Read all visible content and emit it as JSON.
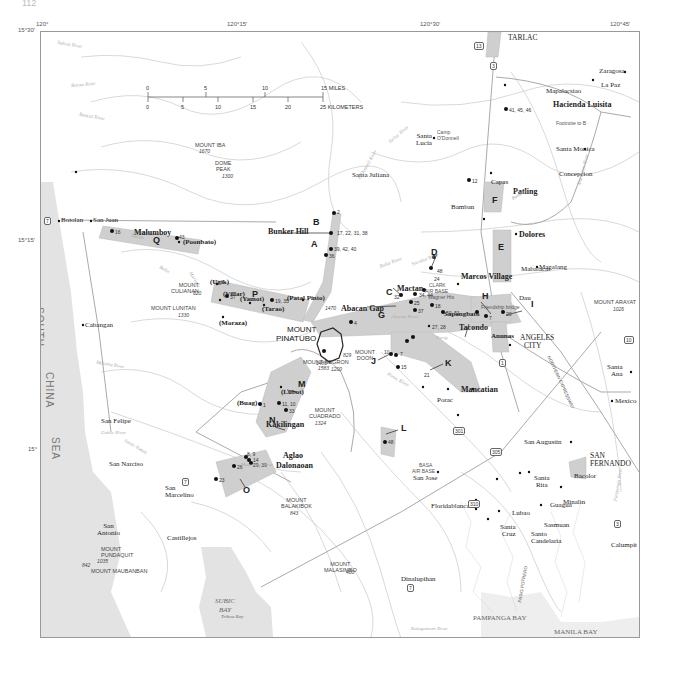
{
  "page": {
    "number": "112"
  },
  "map": {
    "title": "Mount Pinatubo region, Luzon, Philippines",
    "longitude_ticks": [
      "120°",
      "120°15'",
      "120°30'",
      "120°45'"
    ],
    "latitude_ticks": [
      "15°30'",
      "15°15'",
      "15°"
    ],
    "scale_bar": {
      "miles": [
        "0",
        "5",
        "10",
        "15 MILES"
      ],
      "kilometers": [
        "0",
        "5",
        "10",
        "15",
        "20",
        "25 KILOMETERS"
      ]
    },
    "water_bodies": {
      "south_china_sea": [
        "SOUTH",
        "CHINA",
        "SEA"
      ],
      "subic_bay": [
        "SUBIC",
        "BAY"
      ],
      "pampanga_bay": "PAMPANGA BAY",
      "manila_bay": "MANILA BAY",
      "triboa_bay": "Triboa Bay"
    },
    "cities": {
      "tarlac": "TARLAC",
      "angeles": [
        "ANGELES",
        "CITY"
      ],
      "san_fernando": [
        "SAN",
        "FERNANDO"
      ],
      "clark": [
        "CLARK",
        "AIR BASE"
      ],
      "basa": [
        "BASA",
        "AIR BASE"
      ]
    },
    "towns": {
      "botolan": "Botolan",
      "san_juan": "San Juan",
      "malumboy": "Malumboy",
      "poonbato": "(Poonbato)",
      "cabangan": "Cabangan",
      "san_felipe": "San Felipe",
      "san_narciso": "San Narciso",
      "san_marcelino": [
        "San",
        "Marcelino"
      ],
      "san_antonio": [
        "San",
        "Antonio"
      ],
      "castillejos": "Castillejos",
      "ugik": "(Ugik)",
      "villar": "(Villar)",
      "yamot": "(Yamot)",
      "tarao": "(Tarao)",
      "patal_pinto": "(Patal Pinto)",
      "moraza": "(Moraza)",
      "bunker_hill": "Bunker Hill",
      "santa_lucia": [
        "Santa",
        "Lucia"
      ],
      "camp_odonnell": [
        "Camp",
        "O'Donnell"
      ],
      "santa_juliana": "Santa Juliana",
      "mapalacsiao": "Mapalacsiao",
      "hacienda_luisita": "Hacienda Luisita",
      "footnote_b": "Footnote to B",
      "la_paz": "La Paz",
      "zaragosa": "Zaragosa",
      "santa_monica": "Santa Monica",
      "concepcion": "Concepcion",
      "capas": "Capas",
      "patling": "Patling",
      "bamban": "Bamban",
      "dolores": "Dolores",
      "mabalacat": "Mabalacat",
      "magalang": "Magalang",
      "marcos_village": "Marcos Village",
      "mactan": "Mactan",
      "abacan_gap": "Abacan Gap",
      "wagner_hts": "Wagner Hts",
      "sapangbato": "Sapangbato",
      "friendship_bridge": "Friendship bridge",
      "dau": "Dau",
      "tacondo": "Tacondo",
      "anunas": "Anunas",
      "mancatian": "Mancatian",
      "porac": "Porac",
      "santa_ana": [
        "Santa",
        "Ana"
      ],
      "mexico": "Mexico",
      "san_augustin": "San Augustin",
      "santa_rita": [
        "Santa",
        "Rita"
      ],
      "bacolor": "Bacolor",
      "guagua": "Guagua",
      "minalin": "Minalin",
      "lubao": "Lubao",
      "sasmuan": "Sasmuan",
      "santa_cruz": [
        "Santa",
        "Cruz"
      ],
      "santo_candelaria": [
        "Santo",
        "Candelaria"
      ],
      "calumpit": "Calumpit",
      "san_jose": "San Jose",
      "floridablanca": "Floridablanca",
      "dinalupihan": "Dinalupihan",
      "buag": "(Buag)",
      "lubot": "(Lubot)",
      "kakilingan": "Kakilingan",
      "aglao": "Aglao",
      "dalonaoan": "Dalonaoan"
    },
    "mountains": [
      {
        "name": [
          "MOUNT IBA"
        ],
        "elev": "1670"
      },
      {
        "name": [
          "DOME",
          "PEAK"
        ],
        "elev": "1300"
      },
      {
        "name": [
          "MOUNT",
          "CULIANAN"
        ],
        "elev": "620"
      },
      {
        "name": [
          "MOUNT LUNITAN"
        ],
        "elev": "1330"
      },
      {
        "name": [
          "MOUNT",
          "PINATUBO"
        ],
        "elev": "1486"
      },
      {
        "name": [
          "MOUNT NEGRON"
        ],
        "elev": "1583"
      },
      {
        "name": [
          "MOUNT",
          "CUADRADO"
        ],
        "elev": "1324"
      },
      {
        "name": [
          "MOUNT",
          "BALAKIBOK"
        ],
        "elev": "843"
      },
      {
        "name": [
          "MOUNT",
          "MALASIMBO"
        ],
        "elev": "400"
      },
      {
        "name": [
          "MOUNT",
          "PUNDAQUIT"
        ],
        "elev": "1035"
      },
      {
        "name": [
          "MOUNT MAUBANBAN"
        ],
        "elev": "842"
      },
      {
        "name": [
          "MOUNT ARAYAT"
        ],
        "elev": "1026"
      },
      {
        "name": [
          "MOUNT",
          "DOON"
        ],
        "elev": "829"
      }
    ],
    "spot_elevations": {
      "e1470": "1470",
      "e1200": "1200"
    },
    "zones": [
      "A",
      "B",
      "C",
      "D",
      "E",
      "F",
      "G",
      "H",
      "I",
      "J",
      "K",
      "L",
      "M",
      "N",
      "O",
      "P",
      "Q"
    ],
    "site_labels": {
      "b_sites": "2",
      "bunker_sites": "17, 22, 31, 38",
      "a_sites": "39, 42, 40",
      "a_site2": "36",
      "f_site": "12",
      "hacienda_sites": "41, 45, 46",
      "q_site1": "16",
      "q_site2": "43",
      "p_site1": "37",
      "p_site2": "19, 35",
      "g_site": "4",
      "mactan_sites": "34, 44",
      "mactan_site2": "32",
      "mactan_site3": "25",
      "mactan_site4": "18",
      "c_site": "37",
      "g_sites2": "27, 28",
      "d_site1": "48",
      "d_site2": "24",
      "sap_site": "50, 51",
      "h_site": "7",
      "i_site": "20",
      "j_sites1": "10",
      "j_sites2": "7",
      "j_sites3": "15",
      "k_site": "21",
      "l_site": "48",
      "n_site1": "1",
      "n_site2": "11, 10",
      "n_site3": "33",
      "o_site1": "8, 9",
      "o_site2": "14",
      "o_site3": "29, 39",
      "o_site4": "26",
      "o_site5": "23"
    },
    "rivers": {
      "sulcon": "Sulcon River",
      "bucao_n": "Bucao River",
      "bancal": "Bancal River",
      "bucao": "Bucao",
      "balin": "Balin",
      "marimla": "Marimla",
      "maloma": "Maloma River",
      "gabor": "Gabor River",
      "sto_tomas": "Santo Tomas",
      "abacan": "Abacan River",
      "pasig": "Pasig",
      "porac": "Porac River",
      "tarlac": "Tarlac River",
      "odonnell": "O'Donnell River",
      "bulsa": "Bulsa River",
      "sacobia": "Sacobia River",
      "bamban": "Bamban",
      "maraunot": "Maraunot River",
      "pampanga": "Pampanga River",
      "kalaguiman": "Kalaguiman River",
      "mayantoc": "Mayantoc River"
    },
    "highways": [
      "7",
      "3",
      "13",
      "7",
      "1",
      "10",
      "301",
      "305",
      "310",
      "7",
      "3"
    ],
    "other": {
      "expressway": "NORTHERN EXPRESSWAY",
      "pasig_potrero": "PASIG POTRERO"
    }
  }
}
